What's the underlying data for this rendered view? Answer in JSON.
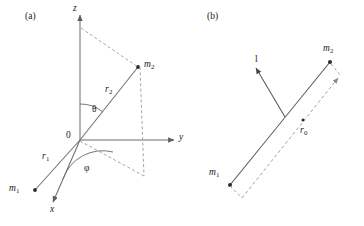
{
  "figure": {
    "type": "scientific-diagram",
    "background_color": "#ffffff",
    "line_color": "#6b6b6b",
    "text_color": "#1b1b1b"
  },
  "panel_a": {
    "tag": "(a)",
    "axes": {
      "z_label": "z",
      "y_label": "y",
      "x_label": "x",
      "origin_label": "0"
    },
    "points": {
      "m1_label": "m",
      "m1_sub": "1",
      "m2_label": "m",
      "m2_sub": "2"
    },
    "vectors": {
      "r1_label": "r",
      "r1_sub": "1",
      "r2_label": "r",
      "r2_sub": "2"
    },
    "angles": {
      "theta_label": "θ",
      "phi_label": "φ"
    }
  },
  "panel_b": {
    "tag": "(b)",
    "points": {
      "m1_label": "m",
      "m1_sub": "1",
      "m2_label": "m",
      "m2_sub": "2"
    },
    "vectors": {
      "l_label": "l",
      "r0_label": "r",
      "r0_sub": "0"
    }
  }
}
